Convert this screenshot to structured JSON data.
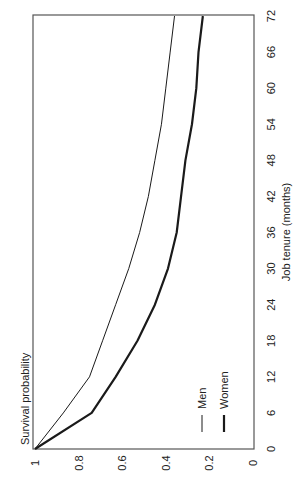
{
  "chart_data": {
    "type": "line",
    "orientation": "rotated 90° clockwise (x-axis runs along right edge, bottom to top)",
    "title": "",
    "xlabel": "Job tenure (months)",
    "ylabel": "Survival probability",
    "x": [
      0,
      6,
      12,
      18,
      24,
      30,
      36,
      42,
      48,
      54,
      60,
      66,
      72
    ],
    "xticks": [
      "0",
      "6",
      "12",
      "18",
      "24",
      "30",
      "36",
      "42",
      "48",
      "54",
      "60",
      "66",
      "72"
    ],
    "yticks": [
      "1",
      "0.8",
      "0.6",
      "0.4",
      "0.2",
      "0"
    ],
    "xlim": [
      0,
      72
    ],
    "ylim": [
      0,
      1
    ],
    "grid": false,
    "legend_position": "inside, lower-right of plot (rotated)",
    "series": [
      {
        "name": "Men",
        "style": "thin",
        "color": "#1a1a1a",
        "values": [
          1.0,
          0.87,
          0.75,
          0.69,
          0.63,
          0.57,
          0.52,
          0.48,
          0.45,
          0.42,
          0.4,
          0.38,
          0.36
        ]
      },
      {
        "name": "Women",
        "style": "thick",
        "color": "#1a1a1a",
        "values": [
          1.0,
          0.74,
          0.63,
          0.53,
          0.45,
          0.39,
          0.35,
          0.33,
          0.31,
          0.28,
          0.26,
          0.25,
          0.23
        ]
      }
    ]
  },
  "legend": {
    "men": "Men",
    "women": "Women"
  }
}
